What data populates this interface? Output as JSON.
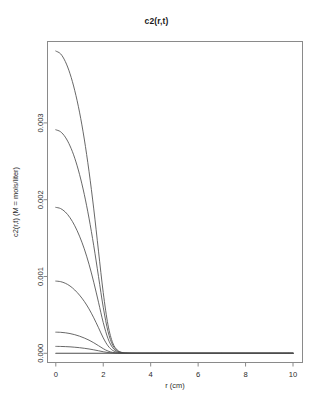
{
  "chart_data": {
    "type": "line",
    "title": "c2(r,t)",
    "xlabel": "r (cm)",
    "ylabel": "c2(r,t) (M = mols/liter)",
    "xlim": [
      -0.35,
      10.4
    ],
    "ylim": [
      -0.00012,
      0.00406
    ],
    "grid": false,
    "legend": "none",
    "xticks": [
      0,
      2,
      4,
      6,
      8,
      10
    ],
    "xtick_labels": [
      "0",
      "2",
      "4",
      "6",
      "8",
      "10"
    ],
    "yticks": [
      0.0,
      0.001,
      0.002,
      0.003
    ],
    "ytick_labels": [
      "0.000",
      "0.001",
      "0.002",
      "0.003"
    ],
    "x": [
      0,
      0.2,
      0.4,
      0.6,
      0.8,
      1.0,
      1.2,
      1.4,
      1.6,
      1.8,
      2.0,
      2.2,
      2.4,
      2.6,
      2.8,
      3.0,
      3.4,
      4.0,
      5.0,
      6.0,
      7.0,
      8.0,
      9.0,
      10.0
    ],
    "series": [
      {
        "name": "t1",
        "values": [
          0.003935,
          0.0039,
          0.0038,
          0.00364,
          0.00342,
          0.00314,
          0.00279,
          0.00237,
          0.00188,
          0.00133,
          0.00079,
          0.00037,
          0.000135,
          4e-05,
          1e-05,
          2e-06,
          0.0,
          0.0,
          0.0,
          0.0,
          0.0,
          0.0,
          0.0,
          0.0
        ]
      },
      {
        "name": "t2",
        "values": [
          0.00291,
          0.002885,
          0.002815,
          0.0027,
          0.00254,
          0.00233,
          0.00207,
          0.00176,
          0.0014,
          0.001,
          0.0006,
          0.000285,
          0.000105,
          3.2e-05,
          8e-06,
          2e-06,
          0.0,
          0.0,
          0.0,
          0.0,
          0.0,
          0.0,
          0.0,
          0.0
        ]
      },
      {
        "name": "t3",
        "values": [
          0.0019,
          0.001885,
          0.00184,
          0.001765,
          0.00166,
          0.001525,
          0.00136,
          0.00116,
          0.000925,
          0.000665,
          0.0004,
          0.000192,
          7.2e-05,
          2.2e-05,
          6e-06,
          1e-06,
          0.0,
          0.0,
          0.0,
          0.0,
          0.0,
          0.0,
          0.0,
          0.0
        ]
      },
      {
        "name": "t4",
        "values": [
          0.00094,
          0.000933,
          0.000912,
          0.000876,
          0.000824,
          0.000757,
          0.000676,
          0.000578,
          0.000462,
          0.000333,
          0.000201,
          9.7e-05,
          3.7e-05,
          1.2e-05,
          3e-06,
          1e-06,
          0.0,
          0.0,
          0.0,
          0.0,
          0.0,
          0.0,
          0.0,
          0.0
        ]
      },
      {
        "name": "t5",
        "values": [
          0.000275,
          0.000273,
          0.000267,
          0.000257,
          0.000242,
          0.000223,
          0.000199,
          0.000171,
          0.000137,
          9.9e-05,
          6e-05,
          2.9e-05,
          1.1e-05,
          4e-06,
          1e-06,
          0.0,
          0.0,
          0.0,
          0.0,
          0.0,
          0.0,
          0.0,
          0.0,
          0.0
        ]
      },
      {
        "name": "t6",
        "values": [
          9e-05,
          8.9e-05,
          8.7e-05,
          8.4e-05,
          7.9e-05,
          7.3e-05,
          6.5e-05,
          5.6e-05,
          4.5e-05,
          3.3e-05,
          2e-05,
          1e-05,
          4e-06,
          1e-06,
          0.0,
          0.0,
          0.0,
          0.0,
          0.0,
          0.0,
          0.0,
          0.0,
          0.0,
          0.0
        ]
      },
      {
        "name": "t0-baseline",
        "values": [
          0.0,
          0.0,
          0.0,
          0.0,
          0.0,
          0.0,
          0.0,
          0.0,
          0.0,
          0.0,
          0.0,
          0.0,
          0.0,
          0.0,
          0.0,
          0.0,
          0.0,
          0.0,
          0.0,
          0.0,
          0.0,
          0.0,
          0.0,
          0.0
        ]
      }
    ],
    "line_color": "#4d4d4d",
    "frame_color": "#8a8a8a"
  }
}
